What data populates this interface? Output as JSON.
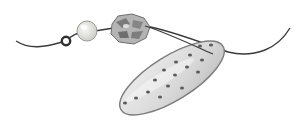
{
  "image": {
    "description": "Grayscale pencil sketch of beads threaded on a string: a small dark ring bead, a pale round pearl, a faceted mottled bead, and a large oval disc with dark spots",
    "colors": {
      "background": "#ffffff",
      "string": "#3a3a3a",
      "ring_bead": "#2e2e2e",
      "pearl": "#e6e6e2",
      "faceted_bead": "#a8a8a8",
      "oval_disc": "#dcdcdc",
      "spots": "#5a5a5a"
    }
  }
}
